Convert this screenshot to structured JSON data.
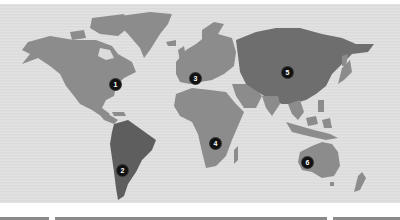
{
  "map": {
    "title": "",
    "colors": {
      "land": "#8c8c8c",
      "land_highlight": "#5e5e5e",
      "ocean": "#dedede",
      "marker": "#111111"
    },
    "markers": [
      {
        "id": "1",
        "label": "1",
        "region": "North America",
        "x": 110,
        "y": 79
      },
      {
        "id": "2",
        "label": "3",
        "region": "Europe",
        "x": 190,
        "y": 73
      },
      {
        "id": "3",
        "label": "2",
        "region": "South America",
        "x": 117,
        "y": 165
      },
      {
        "id": "4",
        "label": "4",
        "region": "Africa",
        "x": 210,
        "y": 138
      },
      {
        "id": "5",
        "label": "5",
        "region": "Asia",
        "x": 282,
        "y": 67
      },
      {
        "id": "6",
        "label": "6",
        "region": "Australia",
        "x": 302,
        "y": 157
      }
    ]
  },
  "footer": {
    "bars": [
      {
        "x": 0,
        "width": 49
      },
      {
        "x": 55,
        "width": 272
      },
      {
        "x": 333,
        "width": 67
      }
    ]
  }
}
